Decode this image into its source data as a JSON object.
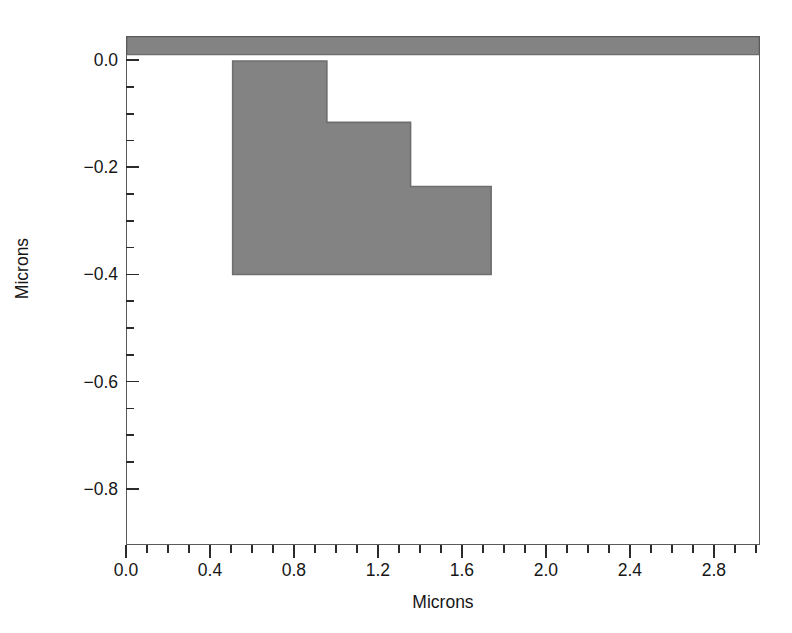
{
  "figure": {
    "background_color": "#ffffff",
    "frame_color": "#5a5a5a",
    "fill_color": "#838383"
  },
  "chart_data": {
    "type": "area",
    "title": "",
    "subtitle": "",
    "xlabel": "Microns",
    "ylabel": "Microns",
    "xlim": [
      0.0,
      3.02
    ],
    "ylim": [
      0.045,
      -0.905
    ],
    "y_axis_inverted": true,
    "grid": false,
    "legend": null,
    "annotations": [],
    "x_ticks_major": [
      0.0,
      0.4,
      0.8,
      1.2,
      1.6,
      2.0,
      2.4,
      2.8
    ],
    "x_ticklabels": [
      "0.0",
      "0.4",
      "0.8",
      "1.2",
      "1.6",
      "2.0",
      "2.4",
      "2.8"
    ],
    "x_tick_minor_step": 0.1,
    "y_ticks_major": [
      -0.8,
      -0.6,
      -0.4,
      -0.2,
      0.0
    ],
    "y_ticklabels": [
      "−0.8",
      "−0.6",
      "−0.4",
      "−0.2",
      "0.0"
    ],
    "y_tick_minor_step": 0.05,
    "series": [
      {
        "name": "resist-feature",
        "fill": "#838383",
        "edge": "#6e6e6e",
        "description": "Staircase photoresist profile with two step-downs",
        "polygon": [
          [
            0.505,
            0.0
          ],
          [
            0.505,
            -0.4
          ],
          [
            1.74,
            -0.4
          ],
          [
            1.74,
            -0.235
          ],
          [
            1.355,
            -0.235
          ],
          [
            1.355,
            -0.115
          ],
          [
            0.955,
            -0.115
          ],
          [
            0.955,
            0.0
          ]
        ]
      },
      {
        "name": "substrate",
        "fill": "#838383",
        "edge": "#6e6e6e",
        "description": "Substrate slab below zero reference plane",
        "polygon": [
          [
            0.0,
            0.012
          ],
          [
            3.02,
            0.012
          ],
          [
            3.02,
            0.045
          ],
          [
            0.0,
            0.045
          ]
        ]
      }
    ]
  }
}
